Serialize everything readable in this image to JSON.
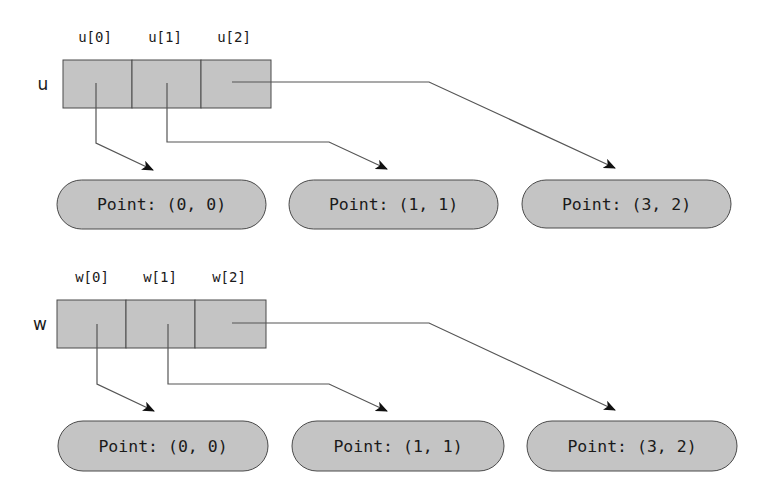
{
  "colors": {
    "fill": "#c4c4c4",
    "stroke": "#4a4a4a",
    "line": "#555555",
    "arrowhead": "#111111",
    "text": "#1a1a1a"
  },
  "diagrams": [
    {
      "variable": "u",
      "indices": [
        "u[0]",
        "u[1]",
        "u[2]"
      ],
      "points": [
        "Point: (0, 0)",
        "Point: (1, 1)",
        "Point: (3, 2)"
      ]
    },
    {
      "variable": "w",
      "indices": [
        "w[0]",
        "w[1]",
        "w[2]"
      ],
      "points": [
        "Point: (0, 0)",
        "Point: (1, 1)",
        "Point: (3, 2)"
      ]
    }
  ]
}
